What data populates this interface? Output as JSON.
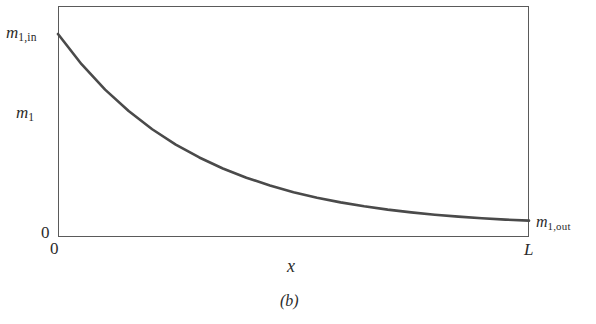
{
  "figure": {
    "caption": "(b)",
    "background_color": "#ffffff",
    "frame_color": "#5a5a5a",
    "curve_color": "#4a4a4a"
  },
  "labels": {
    "y_axis_variable_base": "m",
    "y_axis_variable_sub": "1",
    "y_axis_origin": "0",
    "x_axis_origin": "0",
    "x_axis_end": "L",
    "x_axis_label": "x",
    "inlet_base": "m",
    "inlet_sub": "1,in",
    "outlet_base": "m",
    "outlet_sub": "1,out"
  },
  "chart_data": {
    "type": "line",
    "title": "",
    "xlabel": "x",
    "ylabel": "m1",
    "xlim": [
      0,
      1
    ],
    "ylim": [
      0,
      1
    ],
    "grid": false,
    "legend": null,
    "xtick_labels": [
      "0",
      "L"
    ],
    "ytick_labels": [
      "0"
    ],
    "annotations": [
      {
        "text": "m1,in",
        "x": 0,
        "y": 1.0,
        "position": "left-of-curve-start"
      },
      {
        "text": "m1,out",
        "x": 1,
        "y": 0.03,
        "position": "right-of-curve-end"
      }
    ],
    "series": [
      {
        "name": "m1(x)",
        "description": "exponential decay",
        "x": [
          0,
          0.05,
          0.1,
          0.15,
          0.2,
          0.25,
          0.3,
          0.35,
          0.4,
          0.45,
          0.5,
          0.55,
          0.6,
          0.65,
          0.7,
          0.75,
          0.8,
          0.85,
          0.9,
          0.95,
          1.0
        ],
        "y": [
          1.0,
          0.846,
          0.716,
          0.607,
          0.514,
          0.436,
          0.37,
          0.314,
          0.267,
          0.227,
          0.193,
          0.165,
          0.141,
          0.121,
          0.104,
          0.09,
          0.078,
          0.068,
          0.06,
          0.053,
          0.048
        ]
      }
    ]
  }
}
